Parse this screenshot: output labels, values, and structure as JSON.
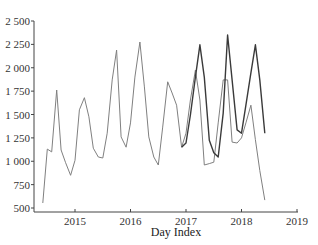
{
  "chart_data": {
    "type": "line",
    "title": "",
    "xlabel": "Day Index",
    "ylabel": "",
    "xlim": [
      2014.4,
      2019.0
    ],
    "ylim": [
      500,
      2500
    ],
    "grid": false,
    "legend": null,
    "x_ticks": [
      "2015",
      "2016",
      "2017",
      "2018",
      "2019"
    ],
    "y_ticks": [
      "500",
      "750",
      "1 000",
      "1 250",
      "1 500",
      "1 750",
      "2 000",
      "2 250",
      "2 500"
    ],
    "series": [
      {
        "name": "actual",
        "color": "#808080",
        "x": [
          2014.42,
          2014.5,
          2014.58,
          2014.67,
          2014.75,
          2014.83,
          2014.92,
          2015.0,
          2015.08,
          2015.17,
          2015.25,
          2015.33,
          2015.42,
          2015.5,
          2015.58,
          2015.67,
          2015.75,
          2015.83,
          2015.92,
          2016.0,
          2016.08,
          2016.17,
          2016.25,
          2016.33,
          2016.42,
          2016.5,
          2016.58,
          2016.67,
          2016.75,
          2016.83,
          2016.92,
          2017.0,
          2017.08,
          2017.17,
          2017.25,
          2017.33,
          2017.42,
          2017.5,
          2017.58,
          2017.67,
          2017.75,
          2017.83,
          2017.92,
          2018.0,
          2018.08,
          2018.17,
          2018.25,
          2018.33,
          2018.42
        ],
        "values": [
          553,
          1130,
          1100,
          1762,
          1120,
          985,
          850,
          1010,
          1550,
          1680,
          1475,
          1140,
          1045,
          1035,
          1300,
          1870,
          2190,
          1260,
          1150,
          1410,
          1900,
          2275,
          1795,
          1260,
          1045,
          960,
          1365,
          1850,
          1730,
          1600,
          1150,
          1300,
          1655,
          1975,
          1655,
          960,
          975,
          990,
          1410,
          1870,
          1870,
          1205,
          1195,
          1250,
          1410,
          1600,
          1230,
          900,
          585
        ]
      },
      {
        "name": "predicted",
        "color": "#3a3a3a",
        "x": [
          2016.92,
          2017.0,
          2017.08,
          2017.17,
          2017.25,
          2017.33,
          2017.42,
          2017.5,
          2017.58,
          2017.67,
          2017.75,
          2017.83,
          2017.92,
          2018.0,
          2018.08,
          2018.17,
          2018.25,
          2018.33,
          2018.42
        ],
        "values": [
          1150,
          1195,
          1495,
          1900,
          2245,
          1900,
          1225,
          1090,
          1045,
          1515,
          2350,
          1870,
          1335,
          1300,
          1600,
          1945,
          2245,
          1870,
          1300
        ]
      }
    ]
  }
}
